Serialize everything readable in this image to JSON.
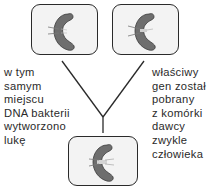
{
  "diagram": {
    "colors": {
      "box_fill": "#f3f3f3",
      "box_border": "#2a2a2a",
      "bacterium_fill": "#6e6e6e",
      "text": "#2a2a2a",
      "line": "#2a2a2a"
    },
    "nodes": [
      {
        "id": "bacterium-with-gap",
        "icon": "bacterium-icon",
        "description": "bacterium with gap in DNA"
      },
      {
        "id": "donor-gene-bacterium",
        "icon": "bacterium-icon",
        "description": "bacterium with donor gene"
      },
      {
        "id": "recombinant-bacterium",
        "icon": "bacterium-icon",
        "description": "bacterium with inserted gene"
      }
    ],
    "left_caption": "w tym\nsamym\nmiejscu\nDNA bakterii\nwytworzono\nlukę",
    "right_caption": "właściwy\ngen został\npobrany\nz komórki\ndawcy\nzwykle\nczłowieka"
  }
}
